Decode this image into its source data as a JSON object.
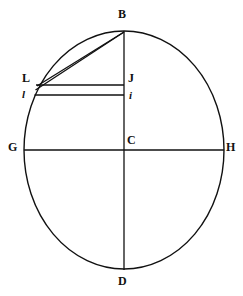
{
  "figure": {
    "background_color": "#ffffff",
    "stroke_color": "#111111",
    "canvas": {
      "width": 243,
      "height": 296
    },
    "ellipse": {
      "name": "main-ellipse",
      "center_x": 124,
      "center_y": 150,
      "radius_x": 100,
      "radius_y": 119,
      "stroke_width": 1.4
    },
    "axes": [
      {
        "name": "vertical-axis-BD",
        "from": "B",
        "to": "D",
        "x1": 124,
        "y1": 31,
        "x2": 124,
        "y2": 270
      },
      {
        "name": "horizontal-axis-GH",
        "from": "G",
        "to": "H",
        "x1": 24,
        "y1": 150,
        "x2": 224,
        "y2": 150
      }
    ],
    "chords": [
      {
        "name": "chord-B-to-L-upper",
        "from": "B",
        "to": "L",
        "x1": 124,
        "y1": 32,
        "x2": 37,
        "y2": 86
      },
      {
        "name": "chord-B-to-L-lower",
        "from": "B",
        "to": "L",
        "x1": 124,
        "y1": 32,
        "x2": 36,
        "y2": 90
      }
    ],
    "ordinates": [
      {
        "name": "ordinate-L-to-J",
        "from": "L",
        "to": "J",
        "x1": 37,
        "y1": 85,
        "x2": 124,
        "y2": 85
      },
      {
        "name": "ordinate-l-to-i",
        "from": "l",
        "to": "i",
        "x1": 35,
        "y1": 95,
        "x2": 124,
        "y2": 95
      }
    ],
    "labels": {
      "B": "B",
      "L": "L",
      "l": "l",
      "J": "J",
      "i": "i",
      "G": "G",
      "C": "C",
      "H": "H",
      "D": "D"
    }
  }
}
